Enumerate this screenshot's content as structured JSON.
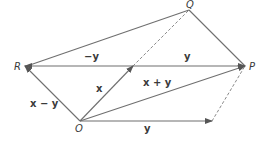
{
  "points": {
    "R": "R",
    "P": "P",
    "Q": "Q",
    "O": "O"
  },
  "labels": {
    "neg_y": "−y",
    "y_top": "y",
    "x": "x",
    "x_plus_y": "x + y",
    "x_minus_y": "x − y",
    "y_bottom": "y"
  },
  "colors": {
    "line": "#6f6f6f",
    "text": "#3a3a3a"
  }
}
